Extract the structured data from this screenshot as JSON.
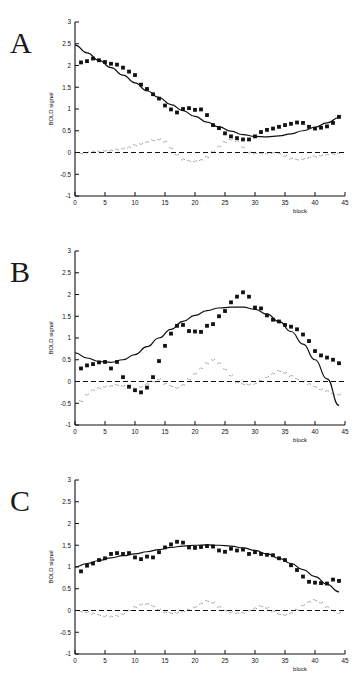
{
  "figure": {
    "background": "#ffffff",
    "panel_letters": [
      "A",
      "B",
      "C"
    ],
    "axis_color": "#111111",
    "marker_color": "#111111",
    "fit_color": "#111111",
    "residual_color": "#555555"
  },
  "panels": [
    {
      "letter": "A"
    },
    {
      "letter": "B"
    },
    {
      "letter": "C"
    }
  ],
  "chart_data": [
    {
      "type": "scatter",
      "title": "",
      "panel": "A",
      "xlabel": "block",
      "ylabel": "BOLD signal",
      "xlim": [
        0,
        45
      ],
      "ylim": [
        -1,
        3
      ],
      "xticks": [
        0,
        5,
        10,
        15,
        20,
        25,
        30,
        35,
        40,
        45
      ],
      "xtick_labels": [
        "0",
        "5",
        "10",
        "15",
        "20",
        "25",
        "30",
        "35",
        "40",
        "45"
      ],
      "yticks": [
        -1,
        -0.5,
        0,
        0.5,
        1,
        1.5,
        2,
        2.5,
        3
      ],
      "ytick_labels": [
        "-1",
        "-0.5",
        "0",
        "0.5",
        "1",
        "1.5",
        "2",
        "2.5",
        "3"
      ],
      "grid": false,
      "legend": "none",
      "series": [
        {
          "name": "BOLD signal data",
          "style": "square-markers",
          "x": [
            1,
            2,
            3,
            4,
            5,
            6,
            7,
            8,
            9,
            10,
            11,
            12,
            13,
            14,
            15,
            16,
            17,
            18,
            19,
            20,
            21,
            22,
            23,
            24,
            25,
            26,
            27,
            28,
            29,
            30,
            31,
            32,
            33,
            34,
            35,
            36,
            37,
            38,
            39,
            40,
            41,
            42,
            43,
            44
          ],
          "values": [
            2.07,
            2.1,
            2.16,
            2.12,
            2.08,
            2.04,
            2.02,
            1.95,
            1.86,
            1.78,
            1.56,
            1.46,
            1.34,
            1.24,
            1.08,
            0.99,
            0.92,
            1.0,
            1.02,
            0.98,
            0.99,
            0.86,
            0.63,
            0.56,
            0.44,
            0.37,
            0.33,
            0.3,
            0.3,
            0.37,
            0.47,
            0.52,
            0.55,
            0.59,
            0.63,
            0.66,
            0.69,
            0.68,
            0.59,
            0.55,
            0.57,
            0.6,
            0.68,
            0.82
          ]
        },
        {
          "name": "fitted curve",
          "style": "solid-line",
          "x": [
            0,
            2,
            4,
            6,
            8,
            10,
            12,
            14,
            16,
            18,
            20,
            22,
            24,
            26,
            28,
            30,
            32,
            34,
            36,
            38,
            40,
            42,
            44
          ],
          "values": [
            2.47,
            2.29,
            2.12,
            1.95,
            1.78,
            1.6,
            1.42,
            1.26,
            1.1,
            0.96,
            0.83,
            0.7,
            0.59,
            0.49,
            0.41,
            0.37,
            0.36,
            0.38,
            0.43,
            0.5,
            0.58,
            0.68,
            0.8
          ]
        },
        {
          "name": "residual",
          "style": "dotted-markers",
          "x": [
            1,
            2,
            3,
            4,
            5,
            6,
            7,
            8,
            9,
            10,
            11,
            12,
            13,
            14,
            15,
            16,
            17,
            18,
            19,
            20,
            21,
            22,
            23,
            24,
            25,
            26,
            27,
            28,
            29,
            30,
            31,
            32,
            33,
            34,
            35,
            36,
            37,
            38,
            39,
            40,
            41,
            42,
            43,
            44
          ],
          "values": [
            -0.02,
            0.0,
            0.02,
            0.02,
            0.04,
            0.05,
            0.07,
            0.09,
            0.12,
            0.17,
            0.2,
            0.24,
            0.28,
            0.3,
            0.25,
            0.1,
            -0.05,
            -0.16,
            -0.19,
            -0.2,
            -0.17,
            -0.1,
            0.02,
            0.14,
            0.24,
            0.3,
            0.26,
            0.12,
            0.0,
            -0.02,
            -0.02,
            -0.02,
            -0.01,
            -0.02,
            -0.08,
            -0.14,
            -0.16,
            -0.15,
            -0.12,
            -0.09,
            -0.07,
            -0.05,
            -0.03,
            -0.01
          ]
        },
        {
          "name": "zero reference",
          "style": "dashed-line",
          "value": 0
        }
      ]
    },
    {
      "type": "scatter",
      "title": "",
      "panel": "B",
      "xlabel": "block",
      "ylabel": "BOLD signal",
      "xlim": [
        0,
        45
      ],
      "ylim": [
        -1,
        3
      ],
      "xticks": [
        0,
        5,
        10,
        15,
        20,
        25,
        30,
        35,
        40,
        45
      ],
      "xtick_labels": [
        "0",
        "5",
        "10",
        "15",
        "20",
        "25",
        "30",
        "35",
        "40",
        "45"
      ],
      "yticks": [
        -1,
        -0.5,
        0,
        0.5,
        1,
        1.5,
        2,
        2.5,
        3
      ],
      "ytick_labels": [
        "-1",
        "-0.5",
        "0",
        "0.5",
        "1",
        "1.5",
        "2",
        "2.5",
        "3"
      ],
      "grid": false,
      "legend": "none",
      "series": [
        {
          "name": "BOLD signal data",
          "style": "square-markers",
          "x": [
            1,
            2,
            3,
            4,
            5,
            6,
            7,
            8,
            9,
            10,
            11,
            12,
            13,
            14,
            15,
            16,
            17,
            18,
            19,
            20,
            21,
            22,
            23,
            24,
            25,
            26,
            27,
            28,
            29,
            30,
            31,
            32,
            33,
            34,
            35,
            36,
            37,
            38,
            39,
            40,
            41,
            42,
            43,
            44
          ],
          "values": [
            0.3,
            0.37,
            0.4,
            0.44,
            0.45,
            0.3,
            0.45,
            0.1,
            -0.12,
            -0.2,
            -0.25,
            -0.14,
            0.1,
            0.47,
            0.82,
            1.1,
            1.28,
            1.3,
            1.16,
            1.15,
            1.14,
            1.28,
            1.32,
            1.5,
            1.62,
            1.82,
            1.95,
            2.05,
            1.95,
            1.7,
            1.68,
            1.52,
            1.42,
            1.38,
            1.3,
            1.26,
            1.2,
            1.08,
            0.93,
            0.7,
            0.6,
            0.55,
            0.5,
            0.42
          ]
        },
        {
          "name": "fitted curve",
          "style": "solid-line",
          "x": [
            0,
            2,
            4,
            6,
            8,
            10,
            12,
            14,
            16,
            18,
            20,
            22,
            24,
            26,
            28,
            30,
            32,
            34,
            36,
            38,
            40,
            42,
            44
          ],
          "values": [
            0.66,
            0.54,
            0.46,
            0.44,
            0.5,
            0.62,
            0.8,
            1.0,
            1.2,
            1.38,
            1.52,
            1.63,
            1.69,
            1.71,
            1.71,
            1.66,
            1.55,
            1.38,
            1.15,
            0.86,
            0.5,
            0.06,
            -0.55
          ]
        },
        {
          "name": "residual",
          "style": "dotted-markers",
          "x": [
            1,
            2,
            3,
            4,
            5,
            6,
            7,
            8,
            9,
            10,
            11,
            12,
            13,
            14,
            15,
            16,
            17,
            18,
            19,
            20,
            21,
            22,
            23,
            24,
            25,
            26,
            27,
            28,
            29,
            30,
            31,
            32,
            33,
            34,
            35,
            36,
            37,
            38,
            39,
            40,
            41,
            42,
            43,
            44
          ],
          "values": [
            -0.45,
            -0.3,
            -0.2,
            -0.15,
            -0.12,
            -0.1,
            -0.08,
            -0.1,
            -0.14,
            -0.16,
            -0.12,
            -0.06,
            0.0,
            0.05,
            -0.05,
            -0.1,
            -0.14,
            -0.08,
            0.05,
            0.18,
            0.3,
            0.42,
            0.5,
            0.42,
            0.28,
            0.14,
            -0.02,
            -0.06,
            -0.07,
            -0.05,
            0.02,
            0.1,
            0.18,
            0.24,
            0.2,
            0.13,
            0.06,
            0.0,
            -0.06,
            -0.12,
            -0.18,
            -0.22,
            -0.28,
            -0.3
          ]
        },
        {
          "name": "zero reference",
          "style": "dashed-line",
          "value": 0
        }
      ]
    },
    {
      "type": "scatter",
      "title": "",
      "panel": "C",
      "xlabel": "block",
      "ylabel": "BOLD signal",
      "xlim": [
        0,
        45
      ],
      "ylim": [
        -1,
        3
      ],
      "xticks": [
        0,
        5,
        10,
        15,
        20,
        25,
        30,
        35,
        40,
        45
      ],
      "xtick_labels": [
        "0",
        "5",
        "10",
        "15",
        "20",
        "25",
        "30",
        "35",
        "40",
        "45"
      ],
      "yticks": [
        -1,
        -0.5,
        0,
        0.5,
        1,
        1.5,
        2,
        2.5,
        3
      ],
      "ytick_labels": [
        "-1",
        "-0.5",
        "0",
        "0.5",
        "1",
        "1.5",
        "2",
        "2.5",
        "3"
      ],
      "grid": false,
      "legend": "none",
      "series": [
        {
          "name": "BOLD signal data",
          "style": "square-markers",
          "x": [
            1,
            2,
            3,
            4,
            5,
            6,
            7,
            8,
            9,
            10,
            11,
            12,
            13,
            14,
            15,
            16,
            17,
            18,
            19,
            20,
            21,
            22,
            23,
            24,
            25,
            26,
            27,
            28,
            29,
            30,
            31,
            32,
            33,
            34,
            35,
            36,
            37,
            38,
            39,
            40,
            41,
            42,
            43,
            44
          ],
          "values": [
            0.9,
            1.03,
            1.08,
            1.16,
            1.2,
            1.3,
            1.32,
            1.3,
            1.32,
            1.22,
            1.18,
            1.24,
            1.22,
            1.34,
            1.45,
            1.52,
            1.58,
            1.56,
            1.45,
            1.44,
            1.46,
            1.48,
            1.47,
            1.38,
            1.35,
            1.42,
            1.38,
            1.4,
            1.3,
            1.34,
            1.3,
            1.28,
            1.27,
            1.2,
            1.16,
            1.04,
            0.93,
            0.78,
            0.66,
            0.64,
            0.63,
            0.62,
            0.71,
            0.68
          ]
        },
        {
          "name": "fitted curve",
          "style": "solid-line",
          "x": [
            0,
            2,
            4,
            6,
            8,
            10,
            12,
            14,
            16,
            18,
            20,
            22,
            24,
            26,
            28,
            30,
            32,
            34,
            36,
            38,
            40,
            42,
            44
          ],
          "values": [
            1.0,
            1.08,
            1.15,
            1.21,
            1.26,
            1.3,
            1.35,
            1.4,
            1.45,
            1.48,
            1.5,
            1.51,
            1.5,
            1.48,
            1.44,
            1.38,
            1.3,
            1.2,
            1.08,
            0.94,
            0.78,
            0.6,
            0.43
          ]
        },
        {
          "name": "residual",
          "style": "dotted-markers",
          "x": [
            1,
            2,
            3,
            4,
            5,
            6,
            7,
            8,
            9,
            10,
            11,
            12,
            13,
            14,
            15,
            16,
            17,
            18,
            19,
            20,
            21,
            22,
            23,
            24,
            25,
            26,
            27,
            28,
            29,
            30,
            31,
            32,
            33,
            34,
            35,
            36,
            37,
            38,
            39,
            40,
            41,
            42,
            43,
            44
          ],
          "values": [
            -0.02,
            -0.04,
            -0.07,
            -0.1,
            -0.13,
            -0.14,
            -0.12,
            -0.08,
            0.0,
            0.08,
            0.14,
            0.15,
            0.1,
            0.02,
            -0.04,
            -0.06,
            -0.05,
            -0.02,
            0.02,
            0.08,
            0.16,
            0.22,
            0.18,
            0.08,
            0.0,
            -0.04,
            -0.06,
            -0.05,
            0.0,
            0.05,
            0.1,
            0.06,
            -0.02,
            -0.08,
            -0.1,
            -0.06,
            0.02,
            0.12,
            0.2,
            0.24,
            0.18,
            0.08,
            0.0,
            -0.06
          ]
        },
        {
          "name": "zero reference",
          "style": "dashed-line",
          "value": 0
        }
      ]
    }
  ]
}
